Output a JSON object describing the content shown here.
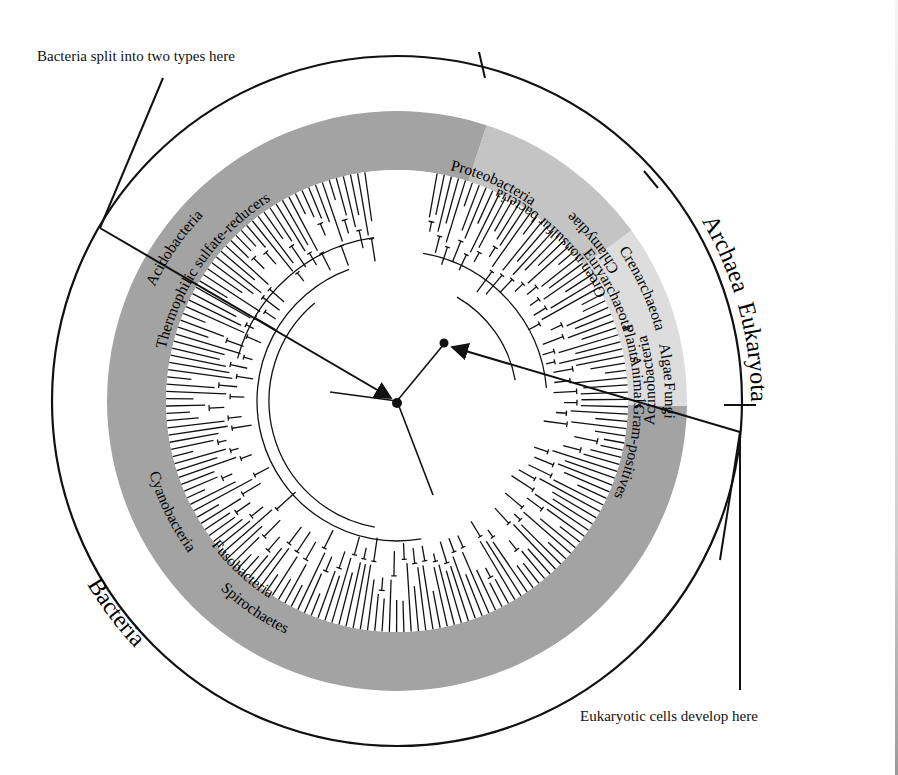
{
  "diagram": {
    "type": "circular phylogenetic tree",
    "center": [
      397,
      401
    ],
    "outer_ring_radius": 345,
    "band_outer_radius": 290,
    "band_inner_radius": 231,
    "leaf_inner_radius": 152,
    "colors": {
      "bacteria_band": "#a3a3a3",
      "archaea_band": "#c4c4c4",
      "eukaryota_band": "#dddddd",
      "line": "#111111",
      "background": "#ffffff"
    }
  },
  "domains": [
    {
      "id": "archaea",
      "label": "Archaea",
      "start_deg": -72,
      "end_deg": -36
    },
    {
      "id": "eukaryota",
      "label": "Eukaryota",
      "start_deg": -36,
      "end_deg": 1
    },
    {
      "id": "bacteria",
      "label": "Bacteria",
      "start_deg": 1,
      "end_deg": 213
    }
  ],
  "groups": [
    {
      "label": "Proteobacteria",
      "ring": "inner",
      "domain": "bacteria"
    },
    {
      "label": "Crenarchaeota",
      "ring": "outer",
      "domain": "archaea"
    },
    {
      "label": "Euryarchaeota",
      "ring": "inner",
      "domain": "archaea"
    },
    {
      "label": "Algae",
      "ring": "outer",
      "domain": "eukaryota"
    },
    {
      "label": "Plants",
      "ring": "inner",
      "domain": "eukaryota"
    },
    {
      "label": "Animals",
      "ring": "inner",
      "domain": "eukaryota"
    },
    {
      "label": "Fungi",
      "ring": "outer",
      "domain": "eukaryota"
    },
    {
      "label": "Gram-positives",
      "ring": "inner",
      "domain": "bacteria"
    },
    {
      "label": "Chlamydiae",
      "ring": "outer",
      "domain": "bacteria"
    },
    {
      "label": "Green nonsulfur bacteria",
      "ring": "inner",
      "domain": "bacteria"
    },
    {
      "label": "Actinobacteria",
      "ring": "outer",
      "domain": "bacteria"
    },
    {
      "label": "Fusobacteria",
      "ring": "inner",
      "domain": "bacteria"
    },
    {
      "label": "Spirochaetes",
      "ring": "outer",
      "domain": "bacteria"
    },
    {
      "label": "Cyanobacteria",
      "ring": "outer",
      "domain": "bacteria"
    },
    {
      "label": "Thermophilic sulfate-reducers",
      "ring": "inner",
      "domain": "bacteria"
    },
    {
      "label": "Acidobacteria",
      "ring": "outer",
      "domain": "bacteria"
    }
  ],
  "annotations": {
    "bacteria_split": "Bacteria split into two types here",
    "eukaryotic_cells": "Eukaryotic cells develop here"
  }
}
